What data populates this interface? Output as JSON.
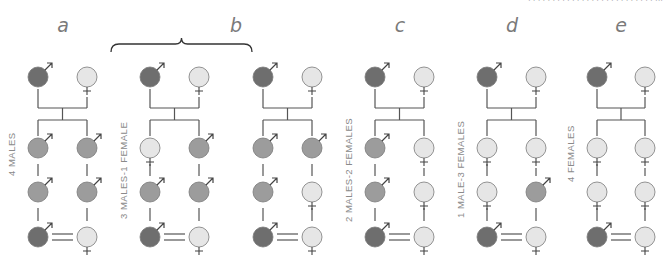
{
  "header": {
    "text": "· · · · · · · · · · · · · · · · · · · · · · · · · ·     ···"
  },
  "colors": {
    "male_dark": "#6e6e6e",
    "male_mid": "#9c9c9c",
    "female": "#e6e6e6",
    "stroke": "#7a7a7a",
    "line": "#555555",
    "brace": "#333333"
  },
  "panels": [
    {
      "letter": "a",
      "label": "4 MALES",
      "x1": 38,
      "x2": 87,
      "gen1": [
        "M-dark",
        "F"
      ],
      "left": [
        "M",
        "M",
        "M-dark"
      ],
      "right": [
        "M",
        "M",
        "F"
      ]
    },
    {
      "letter": "b",
      "label": "3 MALES-1 FEMALE",
      "x1": 150,
      "x2": 199,
      "gen1": [
        "M-dark",
        "F"
      ],
      "left": [
        "F",
        "M",
        "M-dark"
      ],
      "right": [
        "M",
        "M",
        "F"
      ]
    },
    {
      "letter": "",
      "label": "",
      "x1": 263,
      "x2": 312,
      "gen1": [
        "M-dark",
        "F"
      ],
      "left": [
        "M",
        "M",
        "M-dark"
      ],
      "right": [
        "M",
        "F",
        "F"
      ]
    },
    {
      "letter": "c",
      "label": "2 MALES-2 FEMALES",
      "x1": 375,
      "x2": 424,
      "gen1": [
        "M-dark",
        "F"
      ],
      "left": [
        "M",
        "M",
        "M-dark"
      ],
      "right": [
        "F",
        "F",
        "F"
      ]
    },
    {
      "letter": "d",
      "label": "1 MALE-3 FEMALES",
      "x1": 487,
      "x2": 536,
      "gen1": [
        "M-dark",
        "F"
      ],
      "left": [
        "F",
        "F",
        "M-dark"
      ],
      "right": [
        "F",
        "M",
        "F"
      ]
    },
    {
      "letter": "e",
      "label": "4 FEMALES",
      "x1": 597,
      "x2": 645,
      "gen1": [
        "M-dark",
        "F"
      ],
      "left": [
        "F",
        "F",
        "M-dark"
      ],
      "right": [
        "F",
        "F",
        "F"
      ]
    }
  ],
  "letters": [
    {
      "text": "a",
      "x": 63
    },
    {
      "text": "b",
      "x": 236
    },
    {
      "text": "c",
      "x": 400
    },
    {
      "text": "d",
      "x": 512
    },
    {
      "text": "e",
      "x": 621
    }
  ],
  "labels": [
    {
      "text": "4 MALES",
      "x": 8,
      "y": 172
    },
    {
      "text": "3 MALES-1 FEMALE",
      "x": 120,
      "y": 213
    },
    {
      "text": "2 MALES-2 FEMALES",
      "x": 345,
      "y": 215
    },
    {
      "text": "1 MALE-3 FEMALES",
      "x": 457,
      "y": 213
    },
    {
      "text": "4 FEMALES",
      "x": 567,
      "y": 181
    }
  ],
  "rows_y": {
    "gen1": 77,
    "gen2": 148,
    "gen3": 192,
    "gen4": 237
  },
  "brace": {
    "x1": 111,
    "x2": 252,
    "y": 44
  }
}
